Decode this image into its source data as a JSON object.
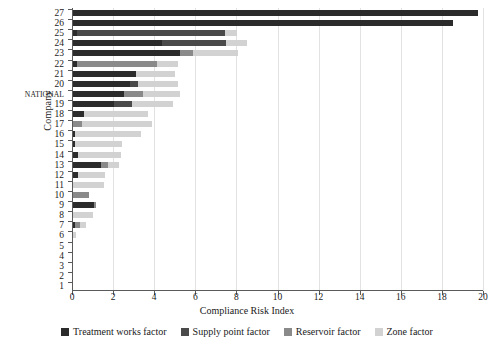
{
  "chart_data": {
    "type": "bar",
    "orientation": "horizontal",
    "stacked": true,
    "title": "",
    "xlabel": "Compliance Risk Index",
    "ylabel": "Company",
    "xlim": [
      0,
      20
    ],
    "xticks": [
      0,
      2,
      4,
      6,
      8,
      10,
      12,
      14,
      16,
      18,
      20
    ],
    "grid": "vertical",
    "legend_position": "bottom",
    "categories": [
      "27",
      "26",
      "25",
      "24",
      "23",
      "22",
      "21",
      "20",
      "NATIONAL",
      "19",
      "18",
      "17",
      "16",
      "15",
      "14",
      "13",
      "12",
      "11",
      "10",
      "9",
      "8",
      "7",
      "6",
      "5",
      "4",
      "3",
      "2",
      "1"
    ],
    "series": [
      {
        "name": "Treatment works factor",
        "color": "#2b2b2b",
        "values": [
          19.7,
          18.5,
          0.18,
          4.35,
          5.2,
          0.2,
          3.05,
          2.75,
          2.5,
          2.0,
          0.55,
          0.0,
          0.1,
          0.08,
          0.22,
          1.35,
          0.22,
          0.0,
          0.0,
          1.0,
          0.0,
          0.1,
          0.0,
          0.0,
          0.0,
          0.0,
          0.0,
          0.0
        ]
      },
      {
        "name": "Supply point factor",
        "color": "#4a4a4a",
        "values": [
          0.0,
          0.0,
          7.2,
          3.1,
          0.0,
          0.0,
          0.0,
          0.4,
          0.0,
          0.85,
          0.0,
          0.0,
          0.0,
          0.0,
          0.0,
          0.0,
          0.0,
          0.0,
          0.0,
          0.0,
          0.0,
          0.0,
          0.0,
          0.0,
          0.0,
          0.0,
          0.0,
          0.0
        ]
      },
      {
        "name": "Reservoir factor",
        "color": "#8a8a8a",
        "values": [
          0.0,
          0.0,
          0.0,
          0.0,
          0.65,
          3.9,
          0.0,
          0.0,
          0.9,
          0.0,
          0.0,
          0.45,
          0.0,
          0.0,
          0.0,
          0.35,
          0.0,
          0.0,
          0.8,
          0.1,
          0.0,
          0.25,
          0.0,
          0.0,
          0.0,
          0.0,
          0.0,
          0.0
        ]
      },
      {
        "name": "Zone factor",
        "color": "#d2d2d2",
        "values": [
          0.0,
          0.0,
          0.6,
          1.0,
          2.2,
          1.0,
          1.9,
          1.95,
          1.8,
          2.0,
          3.1,
          3.4,
          3.2,
          2.3,
          2.1,
          0.55,
          1.35,
          1.5,
          0.0,
          0.0,
          0.95,
          0.3,
          0.15,
          0.0,
          0.0,
          0.0,
          0.0,
          0.0
        ]
      }
    ]
  }
}
